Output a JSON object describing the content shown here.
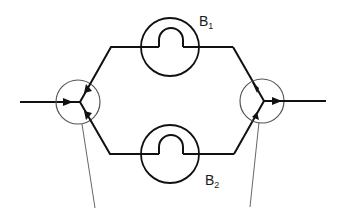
{
  "diagram": {
    "title": "",
    "colors": {
      "line": "#111111",
      "circle_thin": "#555555",
      "leader": "#666666",
      "background": "#ffffff"
    },
    "labels": {
      "b1": {
        "base": "B",
        "sub": "1"
      },
      "b2": {
        "base": "B",
        "sub": "2"
      }
    },
    "nodes": {
      "split_junction": {
        "cx": 78,
        "cy": 102,
        "r": 22
      },
      "merge_junction": {
        "cx": 262,
        "cy": 101,
        "r": 22
      },
      "branch_b1": {
        "cx": 170,
        "cy": 47,
        "r": 29
      },
      "branch_b2": {
        "cx": 170,
        "cy": 154,
        "r": 29
      }
    },
    "edges": [
      {
        "from": "input",
        "to": "split_junction",
        "arrow": true
      },
      {
        "from": "split_junction",
        "to": "branch_b1",
        "arrow": true
      },
      {
        "from": "split_junction",
        "to": "branch_b2",
        "arrow": true
      },
      {
        "from": "branch_b1",
        "to": "merge_junction",
        "arrow": true
      },
      {
        "from": "branch_b2",
        "to": "merge_junction",
        "arrow": true
      },
      {
        "from": "merge_junction",
        "to": "output",
        "arrow": true
      }
    ]
  }
}
